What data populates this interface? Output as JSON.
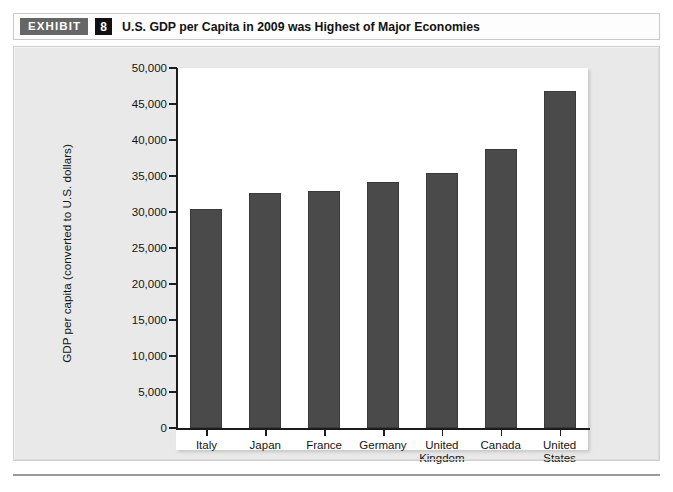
{
  "exhibit": {
    "tag_label": "EXHIBIT",
    "number": "8",
    "title": "U.S. GDP per Capita in 2009 was Highest of Major Economies"
  },
  "colors": {
    "bar_fill": "#4a4a4a",
    "bar_stroke": "#3a3a3a",
    "panel_bg": "#e9e9e9",
    "plot_bg": "#ffffff",
    "axis": "#1c1c1c",
    "tag_bg": "#666666",
    "number_bg": "#111111"
  },
  "chart_data": {
    "type": "bar",
    "title": "U.S. GDP per Capita in 2009 was Highest of Major Economies",
    "xlabel": "",
    "ylabel": "GDP per capita (converted to U.S. dollars)",
    "categories": [
      "Italy",
      "Japan",
      "France",
      "Germany",
      "United Kingdom",
      "Canada",
      "United States"
    ],
    "category_lines": [
      [
        "Italy"
      ],
      [
        "Japan"
      ],
      [
        "France"
      ],
      [
        "Germany"
      ],
      [
        "United",
        "Kingdom"
      ],
      [
        "Canada"
      ],
      [
        "United",
        "States"
      ]
    ],
    "values": [
      30400,
      32700,
      32900,
      34200,
      35400,
      38700,
      46800
    ],
    "ylim": [
      0,
      50000
    ],
    "yticks": [
      0,
      5000,
      10000,
      15000,
      20000,
      25000,
      30000,
      35000,
      40000,
      45000,
      50000
    ],
    "ytick_labels": [
      "0",
      "5,000",
      "10,000",
      "15,000",
      "20,000",
      "25,000",
      "30,000",
      "35,000",
      "40,000",
      "45,000",
      "50,000"
    ],
    "grid": false,
    "legend": false
  }
}
